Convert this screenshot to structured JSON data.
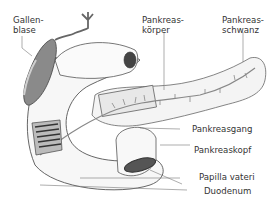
{
  "diagram": {
    "labels": {
      "gallbladder": "Gallen-\nblase",
      "pancreas_body": "Pankreas-\nkörper",
      "pancreas_tail": "Pankreas-\nschwanz",
      "pancreatic_duct": "Pankreasgang",
      "pancreas_head": "Pankreaskopf",
      "papilla": "Papilla vateri",
      "duodenum": "Duodenum"
    },
    "colors": {
      "outline": "#555555",
      "gallbladder": "#8a8a8a",
      "duct": "#777777",
      "tissue": "#f2f2f2"
    }
  }
}
